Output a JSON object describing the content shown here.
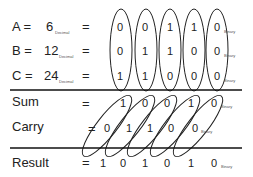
{
  "rows": {
    "a": {
      "label": "A =",
      "value": "6",
      "unit": "Decimal",
      "eq": "=",
      "bits": [
        "0",
        "0",
        "1",
        "1",
        "0"
      ],
      "bits_unit": "Binary"
    },
    "b": {
      "label": "B =",
      "value": "12",
      "unit": "Decimal",
      "eq": "=",
      "bits": [
        "0",
        "1",
        "1",
        "0",
        "0"
      ],
      "bits_unit": "Binary"
    },
    "c": {
      "label": "C =",
      "value": "24",
      "unit": "Decimal",
      "eq": "=",
      "bits": [
        "1",
        "1",
        "0",
        "0",
        "0"
      ],
      "bits_unit": "Binary"
    },
    "sum": {
      "label": "Sum",
      "eq": "=",
      "bits": [
        "1",
        "0",
        "0",
        "1",
        "0"
      ],
      "bits_unit": "Binary"
    },
    "carry": {
      "label": "Carry",
      "eq": "=",
      "bits": [
        "0",
        "1",
        "1",
        "0",
        "0"
      ],
      "bits_unit": "Binary"
    },
    "result": {
      "label": "Result",
      "eq": "=",
      "bits": [
        "1",
        "0",
        "1",
        "0",
        "1",
        "0"
      ],
      "bits_unit": "Binary"
    }
  }
}
